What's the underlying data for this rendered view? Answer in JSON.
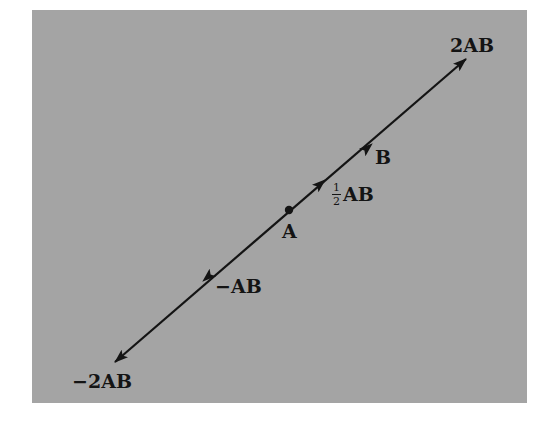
{
  "figure": {
    "background_color": "#a4a4a4",
    "ink_color": "#141414",
    "line": {
      "start": {
        "x": 115,
        "y": 362
      },
      "end": {
        "x": 466,
        "y": 59
      }
    },
    "point_A": {
      "x": 289,
      "y": 210,
      "label": "A"
    },
    "vectors": [
      {
        "name": "2AB",
        "label": "2AB",
        "tip": {
          "x": 466,
          "y": 59
        }
      },
      {
        "name": "AB",
        "label": "B",
        "tip": {
          "x": 372,
          "y": 144
        }
      },
      {
        "name": "half-AB",
        "label_fraction_num": "1",
        "label_fraction_den": "2",
        "label": "AB",
        "tip": {
          "x": 325,
          "y": 180
        }
      },
      {
        "name": "neg-AB",
        "label": "−AB",
        "tip": {
          "x": 203,
          "y": 281
        }
      },
      {
        "name": "neg-2AB",
        "label": "−2AB",
        "tip": {
          "x": 115,
          "y": 362
        }
      }
    ]
  }
}
